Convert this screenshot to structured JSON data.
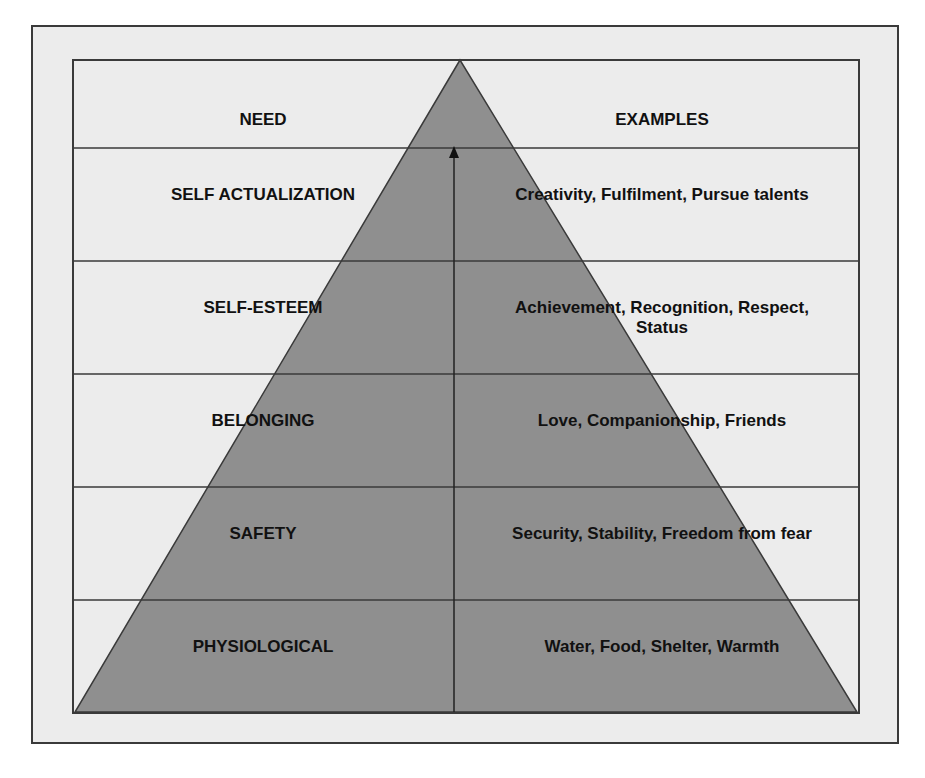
{
  "diagram": {
    "headers": {
      "need": "NEED",
      "examples": "EXAMPLES"
    },
    "levels": [
      {
        "need": "SELF ACTUALIZATION",
        "examples": "Creativity, Fulfilment, Pursue talents"
      },
      {
        "need": "SELF-ESTEEM",
        "examples": "Achievement, Recognition, Respect, Status"
      },
      {
        "need": "BELONGING",
        "examples": "Love, Companionship, Friends"
      },
      {
        "need": "SAFETY",
        "examples": "Security, Stability, Freedom from fear"
      },
      {
        "need": "PHYSIOLOGICAL",
        "examples": "Water, Food, Shelter, Warmth"
      }
    ],
    "colors": {
      "background": "#ececec",
      "pyramid_fill": "#8f8f8f",
      "lines": "#3a3a3a",
      "text": "#111111"
    }
  }
}
